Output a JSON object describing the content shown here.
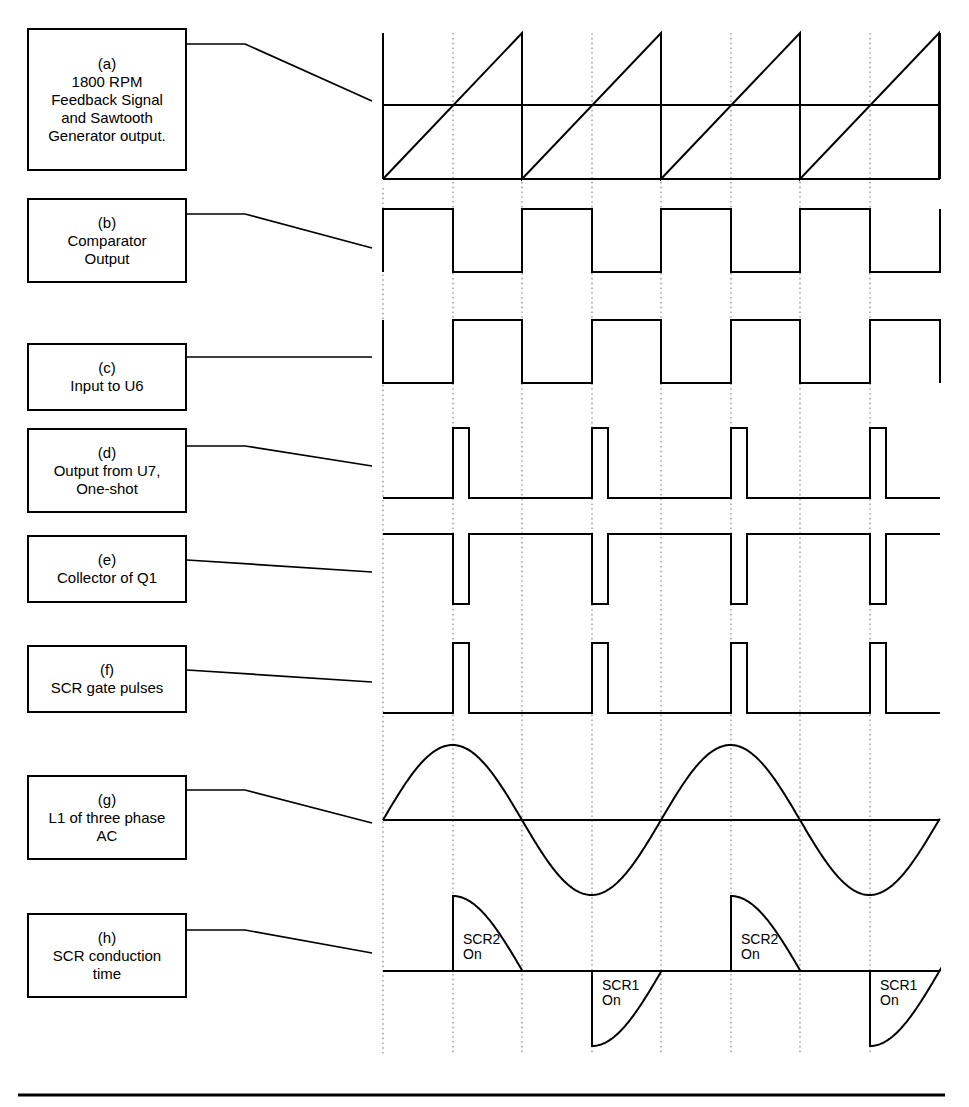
{
  "figure": {
    "line_color": "#000000",
    "grid_color": "#9a9a9a",
    "background": "#ffffff"
  },
  "panels": [
    {
      "key": "a",
      "tag": "(a)",
      "lines": [
        "1800 RPM",
        "Feedback Signal",
        "and Sawtooth",
        "Generator output."
      ],
      "waveform": "sawtooth-with-dc-reference"
    },
    {
      "key": "b",
      "tag": "(b)",
      "lines": [
        "Comparator",
        "Output"
      ],
      "waveform": "square-high-first"
    },
    {
      "key": "c",
      "tag": "(c)",
      "lines": [
        "Input to U6"
      ],
      "waveform": "square-low-first"
    },
    {
      "key": "d",
      "tag": "(d)",
      "lines": [
        "Output from U7,",
        "One-shot"
      ],
      "waveform": "narrow-pulse-train"
    },
    {
      "key": "e",
      "tag": "(e)",
      "lines": [
        "Collector of Q1"
      ],
      "waveform": "inverted-narrow-pulse-train"
    },
    {
      "key": "f",
      "tag": "(f)",
      "lines": [
        "SCR gate pulses"
      ],
      "waveform": "narrow-pulse-train"
    },
    {
      "key": "g",
      "tag": "(g)",
      "lines": [
        "L1 of three phase",
        "AC"
      ],
      "waveform": "sine-two-cycles"
    },
    {
      "key": "h",
      "tag": "(h)",
      "lines": [
        "SCR conduction",
        "time"
      ],
      "waveform": "scr-conduction-segments"
    }
  ],
  "conduction_labels": [
    {
      "name": "SCR2",
      "state": "On"
    },
    {
      "name": "SCR1",
      "state": "On"
    },
    {
      "name": "SCR2",
      "state": "On"
    },
    {
      "name": "SCR1",
      "state": "On"
    }
  ],
  "chart_data": {
    "type": "line",
    "xlabel": "",
    "ylabel": "",
    "grid": true,
    "legend": "none",
    "x_gridlines": [
      383,
      453,
      522,
      592,
      661,
      731,
      800,
      870,
      940
    ],
    "plot_left": 383,
    "plot_right": 940,
    "half_cycle_px": 139,
    "firing_delay_px": 70,
    "series": [
      {
        "name": "(a) sawtooth generator output",
        "type": "sawtooth",
        "baseline_y": 179,
        "peak_y": 33,
        "period_px": 139,
        "cycles": 4,
        "start_x": 383
      },
      {
        "name": "(a) 1800 RPM feedback DC level",
        "type": "horizontal-reference",
        "y": 105,
        "x_from": 383,
        "x_to": 940
      },
      {
        "name": "(b) comparator output",
        "type": "square",
        "high_y": 209,
        "low_y": 272,
        "first_state": "high",
        "transitions": [
          383,
          453,
          522,
          592,
          661,
          731,
          800,
          870,
          940
        ]
      },
      {
        "name": "(c) input to U6",
        "type": "square",
        "high_y": 320,
        "low_y": 383,
        "first_state": "low",
        "transitions": [
          383,
          453,
          522,
          592,
          661,
          731,
          800,
          870,
          940
        ]
      },
      {
        "name": "(d) one-shot output from U7",
        "type": "pulse-train",
        "low_y": 498,
        "high_y": 428,
        "pulse_starts": [
          453,
          592,
          731,
          870
        ],
        "pulse_width_px": 16
      },
      {
        "name": "(e) collector of Q1",
        "type": "inverted-pulse-train",
        "high_y": 534,
        "low_y": 604,
        "pulse_starts": [
          453,
          592,
          731,
          870
        ],
        "pulse_width_px": 16
      },
      {
        "name": "(f) SCR gate pulses",
        "type": "pulse-train",
        "low_y": 713,
        "high_y": 643,
        "pulse_starts": [
          453,
          592,
          731,
          870
        ],
        "pulse_width_px": 16
      },
      {
        "name": "(g) L1 of three phase AC",
        "type": "sine",
        "zero_y": 820,
        "amplitude_px": 75,
        "period_px": 278,
        "cycles": 2,
        "start_x": 383,
        "start_phase": "zero-rising"
      },
      {
        "name": "(h) SCR conduction time",
        "type": "conduction-segments",
        "zero_y": 971,
        "amplitude_px": 75,
        "segments": [
          {
            "label": "SCR2",
            "polarity": "positive",
            "x_from": 453,
            "x_to": 522
          },
          {
            "label": "SCR1",
            "polarity": "negative",
            "x_from": 592,
            "x_to": 661
          },
          {
            "label": "SCR2",
            "polarity": "positive",
            "x_from": 731,
            "x_to": 800
          },
          {
            "label": "SCR1",
            "polarity": "negative",
            "x_from": 870,
            "x_to": 940
          }
        ]
      }
    ]
  }
}
